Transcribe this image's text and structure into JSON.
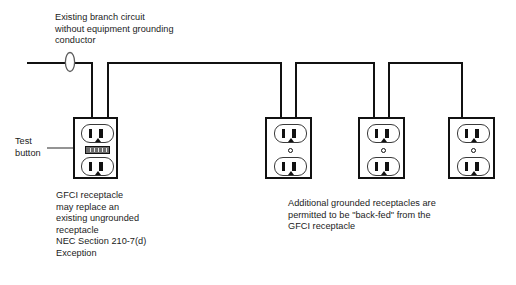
{
  "diagram": {
    "colors": {
      "background": "#ffffff",
      "wire": "#111111",
      "text": "#1b1b1b",
      "test_button_fill": "#6d6d6d"
    },
    "labels": {
      "branch_circuit": "Existing branch circuit\nwithout equipment grounding\nconductor",
      "test_button": "Test\nbutton",
      "gfci_note": "GFCI receptacle\nmay replace an\nexisting ungrounded\nreceptacle\nNEC Section 210-7(d)\nException",
      "backfed_note": "Additional grounded receptacles are\npermitted to be \"back-fed\" from the\nGFCI receptacle"
    },
    "receptacles": [
      {
        "id": "gfci-receptacle",
        "kind": "gfci-duplex",
        "has_test_button": true,
        "has_center_screw": false,
        "wire_count": 2
      },
      {
        "id": "grounded-receptacle-1",
        "kind": "grounded-duplex",
        "has_test_button": false,
        "has_center_screw": true,
        "wire_count": 2
      },
      {
        "id": "grounded-receptacle-2",
        "kind": "grounded-duplex",
        "has_test_button": false,
        "has_center_screw": true,
        "wire_count": 2
      },
      {
        "id": "grounded-receptacle-3",
        "kind": "grounded-duplex",
        "has_test_button": false,
        "has_center_screw": true,
        "wire_count": 1
      }
    ],
    "symbols": {
      "wire_break": "wire-break-loop",
      "leader_arrow": "arrow-pointer"
    }
  }
}
